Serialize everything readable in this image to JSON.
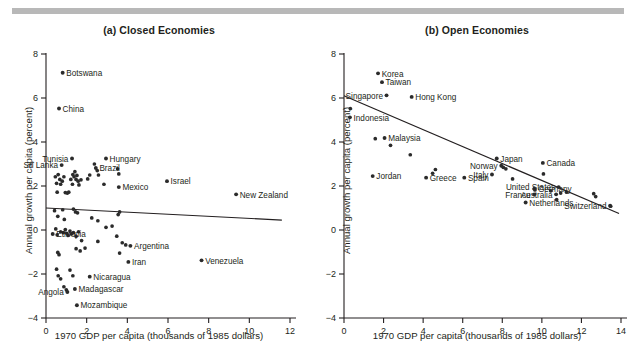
{
  "figure": {
    "top_rule_color": "#b8b8b8",
    "axis_color": "#231f20",
    "point_color": "#2b2b2b",
    "trend_color": "#231f20"
  },
  "panels": [
    {
      "id": "a",
      "title": "(a) Closed Economies",
      "xlabel": "1970 GDP per capita (thousands of 1985 dollars)",
      "ylabel": "Annual growth per capita (percent)"
    },
    {
      "id": "b",
      "title": "(b) Open Economies",
      "xlabel": "1970 GDP per capita (thousands of 1985 dollars)",
      "ylabel": "Annual growth per capita (percent)"
    }
  ],
  "chart_data": [
    {
      "type": "scatter",
      "title": "(a) Closed Economies",
      "xlabel": "1970 GDP per capita (thousands of 1985 dollars)",
      "ylabel": "Annual growth per capita (percent)",
      "xlim": [
        0,
        12
      ],
      "ylim": [
        -4,
        8
      ],
      "xticks": [
        0,
        2,
        4,
        6,
        8,
        10,
        12
      ],
      "yticks": [
        -4,
        -2,
        0,
        2,
        4,
        6,
        8
      ],
      "grid": false,
      "legend": false,
      "trendline": {
        "x0": 0.0,
        "y0": 1.0,
        "x1": 11.6,
        "y1": 0.45
      },
      "labeled_points": [
        {
          "label": "Botswana",
          "x": 0.82,
          "y": 7.15,
          "label_pos": "right"
        },
        {
          "label": "China",
          "x": 0.64,
          "y": 5.52,
          "label_pos": "right"
        },
        {
          "label": "Tunisia",
          "x": 1.28,
          "y": 3.25,
          "label_pos": "left"
        },
        {
          "label": "Sri Lanka",
          "x": 0.77,
          "y": 2.95,
          "label_pos": "left"
        },
        {
          "label": "Hungary",
          "x": 2.95,
          "y": 3.25,
          "label_pos": "right"
        },
        {
          "label": "Brazil",
          "x": 2.45,
          "y": 2.82,
          "label_pos": "right"
        },
        {
          "label": "Mexico",
          "x": 3.58,
          "y": 1.95,
          "label_pos": "right"
        },
        {
          "label": "Israel",
          "x": 5.95,
          "y": 2.22,
          "label_pos": "right"
        },
        {
          "label": "New Zealand",
          "x": 9.35,
          "y": 1.62,
          "label_pos": "right"
        },
        {
          "label": "Ethiopia",
          "x": 0.33,
          "y": -0.18,
          "label_pos": "right"
        },
        {
          "label": "Argentina",
          "x": 4.15,
          "y": -0.72,
          "label_pos": "right"
        },
        {
          "label": "Iran",
          "x": 4.05,
          "y": -1.45,
          "label_pos": "right"
        },
        {
          "label": "Venezuela",
          "x": 7.65,
          "y": -1.38,
          "label_pos": "right"
        },
        {
          "label": "Nicaragua",
          "x": 2.15,
          "y": -2.12,
          "label_pos": "right"
        },
        {
          "label": "Madagascar",
          "x": 1.42,
          "y": -2.68,
          "label_pos": "right"
        },
        {
          "label": "Angola",
          "x": 1.05,
          "y": -2.82,
          "label_pos": "left"
        },
        {
          "label": "Mozambique",
          "x": 1.52,
          "y": -3.42,
          "label_pos": "right"
        }
      ],
      "unlabeled_points": [
        {
          "x": 0.46,
          "y": 2.42
        },
        {
          "x": 0.52,
          "y": 2.12
        },
        {
          "x": 0.6,
          "y": 2.52
        },
        {
          "x": 0.68,
          "y": 2.3
        },
        {
          "x": 0.72,
          "y": 2.08
        },
        {
          "x": 0.8,
          "y": 2.22
        },
        {
          "x": 0.88,
          "y": 2.42
        },
        {
          "x": 0.55,
          "y": 1.72
        },
        {
          "x": 0.95,
          "y": 1.7
        },
        {
          "x": 1.05,
          "y": 1.68
        },
        {
          "x": 1.12,
          "y": 1.72
        },
        {
          "x": 1.22,
          "y": 2.3
        },
        {
          "x": 1.32,
          "y": 2.52
        },
        {
          "x": 1.38,
          "y": 2.42
        },
        {
          "x": 1.42,
          "y": 2.65
        },
        {
          "x": 1.48,
          "y": 2.3
        },
        {
          "x": 1.52,
          "y": 2.48
        },
        {
          "x": 1.58,
          "y": 2.22
        },
        {
          "x": 1.3,
          "y": 2.08
        },
        {
          "x": 1.62,
          "y": 2.05
        },
        {
          "x": 1.72,
          "y": 2.28
        },
        {
          "x": 2.05,
          "y": 2.32
        },
        {
          "x": 2.15,
          "y": 2.5
        },
        {
          "x": 2.38,
          "y": 3.0
        },
        {
          "x": 2.52,
          "y": 2.7
        },
        {
          "x": 2.58,
          "y": 2.5
        },
        {
          "x": 2.85,
          "y": 2.08
        },
        {
          "x": 3.52,
          "y": 2.78
        },
        {
          "x": 3.58,
          "y": 2.55
        },
        {
          "x": 0.42,
          "y": 0.88
        },
        {
          "x": 0.58,
          "y": 0.62
        },
        {
          "x": 0.82,
          "y": 0.92
        },
        {
          "x": 0.9,
          "y": 0.48
        },
        {
          "x": 1.35,
          "y": 0.95
        },
        {
          "x": 1.45,
          "y": 0.82
        },
        {
          "x": 1.55,
          "y": 0.78
        },
        {
          "x": 2.25,
          "y": 0.55
        },
        {
          "x": 2.55,
          "y": 0.42
        },
        {
          "x": 2.95,
          "y": 0.12
        },
        {
          "x": 3.25,
          "y": 0.18
        },
        {
          "x": 3.55,
          "y": 0.7
        },
        {
          "x": 3.62,
          "y": 0.82
        },
        {
          "x": 0.48,
          "y": 0.05
        },
        {
          "x": 0.55,
          "y": -0.22
        },
        {
          "x": 0.72,
          "y": -0.08
        },
        {
          "x": 0.85,
          "y": -0.12
        },
        {
          "x": 0.95,
          "y": 0.02
        },
        {
          "x": 1.02,
          "y": -0.15
        },
        {
          "x": 1.08,
          "y": -0.25
        },
        {
          "x": 1.18,
          "y": -0.05
        },
        {
          "x": 1.25,
          "y": -0.18
        },
        {
          "x": 1.35,
          "y": -0.12
        },
        {
          "x": 1.48,
          "y": -0.28
        },
        {
          "x": 1.6,
          "y": -0.08
        },
        {
          "x": 1.75,
          "y": -0.48
        },
        {
          "x": 2.55,
          "y": -0.52
        },
        {
          "x": 3.48,
          "y": -0.28
        },
        {
          "x": 3.75,
          "y": -0.58
        },
        {
          "x": 3.92,
          "y": -0.68
        },
        {
          "x": 0.58,
          "y": -1.02
        },
        {
          "x": 0.64,
          "y": -1.12
        },
        {
          "x": 1.48,
          "y": -0.85
        },
        {
          "x": 1.68,
          "y": -0.95
        },
        {
          "x": 1.92,
          "y": -0.82
        },
        {
          "x": 3.62,
          "y": -1.05
        },
        {
          "x": 0.52,
          "y": -1.78
        },
        {
          "x": 0.6,
          "y": -2.08
        },
        {
          "x": 0.72,
          "y": -2.22
        },
        {
          "x": 1.18,
          "y": -1.82
        },
        {
          "x": 1.32,
          "y": -2.08
        },
        {
          "x": 0.88,
          "y": -2.58
        },
        {
          "x": 1.0,
          "y": -2.72
        }
      ]
    },
    {
      "type": "scatter",
      "title": "(b) Open Economies",
      "xlabel": "1970 GDP per capita (thousands of 1985 dollars)",
      "ylabel": "Annual growth per capita (percent)",
      "xlim": [
        0,
        14
      ],
      "ylim": [
        -4,
        8
      ],
      "xticks": [
        0,
        2,
        4,
        6,
        8,
        10,
        12,
        14
      ],
      "yticks": [
        -4,
        -2,
        0,
        2,
        4,
        6,
        8
      ],
      "grid": false,
      "legend": false,
      "trendline": {
        "x0": 0.0,
        "y0": 6.1,
        "x1": 13.9,
        "y1": 0.75
      },
      "labeled_points": [
        {
          "label": "Korea",
          "x": 1.72,
          "y": 7.12,
          "label_pos": "right"
        },
        {
          "label": "Taiwan",
          "x": 1.92,
          "y": 6.72,
          "label_pos": "right"
        },
        {
          "label": "Singapore",
          "x": 2.15,
          "y": 6.12,
          "label_pos": "left"
        },
        {
          "label": "Hong Kong",
          "x": 3.42,
          "y": 6.05,
          "label_pos": "right"
        },
        {
          "label": "Indonesia",
          "x": 0.3,
          "y": 5.12,
          "label_pos": "right"
        },
        {
          "label": "Malaysia",
          "x": 2.05,
          "y": 4.18,
          "label_pos": "right"
        },
        {
          "label": "Jordan",
          "x": 1.45,
          "y": 2.45,
          "label_pos": "right"
        },
        {
          "label": "Greece",
          "x": 4.15,
          "y": 2.38,
          "label_pos": "right"
        },
        {
          "label": "Spain",
          "x": 6.08,
          "y": 2.38,
          "label_pos": "right"
        },
        {
          "label": "Italy",
          "x": 7.48,
          "y": 2.52,
          "label_pos": "left"
        },
        {
          "label": "Norway",
          "x": 7.95,
          "y": 2.92,
          "label_pos": "left"
        },
        {
          "label": "Japan",
          "x": 7.72,
          "y": 3.25,
          "label_pos": "right"
        },
        {
          "label": "Canada",
          "x": 10.05,
          "y": 3.05,
          "label_pos": "right"
        },
        {
          "label": "United States",
          "x": 10.85,
          "y": 1.95,
          "label_pos": "left"
        },
        {
          "label": "Germany",
          "x": 9.62,
          "y": 1.88,
          "label_pos": "right"
        },
        {
          "label": "Australia",
          "x": 10.72,
          "y": 1.62,
          "label_pos": "left"
        },
        {
          "label": "France",
          "x": 9.62,
          "y": 1.62,
          "label_pos": "left"
        },
        {
          "label": "Netherlands",
          "x": 9.18,
          "y": 1.25,
          "label_pos": "right"
        },
        {
          "label": "Switzerland",
          "x": 13.45,
          "y": 1.1,
          "label_pos": "left"
        }
      ],
      "unlabeled_points": [
        {
          "x": 0.32,
          "y": 5.52
        },
        {
          "x": 1.58,
          "y": 4.15
        },
        {
          "x": 2.35,
          "y": 3.85
        },
        {
          "x": 3.35,
          "y": 3.42
        },
        {
          "x": 4.48,
          "y": 2.58
        },
        {
          "x": 4.62,
          "y": 2.75
        },
        {
          "x": 8.52,
          "y": 2.32
        },
        {
          "x": 8.05,
          "y": 2.85
        },
        {
          "x": 8.18,
          "y": 2.78
        },
        {
          "x": 10.08,
          "y": 2.55
        },
        {
          "x": 9.65,
          "y": 1.82
        },
        {
          "x": 10.45,
          "y": 1.78
        },
        {
          "x": 10.95,
          "y": 1.68
        },
        {
          "x": 11.25,
          "y": 1.72
        },
        {
          "x": 12.62,
          "y": 1.65
        },
        {
          "x": 12.72,
          "y": 1.52
        },
        {
          "x": 10.75,
          "y": 1.38
        },
        {
          "x": 13.48,
          "y": 1.08
        }
      ]
    }
  ]
}
